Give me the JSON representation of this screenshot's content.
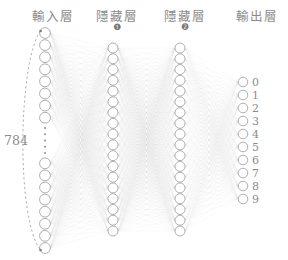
{
  "diagram": {
    "title_layers": [
      {
        "id": "input-layer",
        "label": "輸入層",
        "badge": "",
        "x": 53
      },
      {
        "id": "hidden-layer-1",
        "label": "隱藏層",
        "badge": "❶",
        "x": 117
      },
      {
        "id": "hidden-layer-2",
        "label": "隱藏層",
        "badge": "❷",
        "x": 185
      },
      {
        "id": "output-layer",
        "label": "輸出層",
        "badge": "",
        "x": 257
      }
    ],
    "input_brace_label": "784",
    "ellipsis_symbol": "⋮",
    "output_labels": [
      "0",
      "1",
      "2",
      "3",
      "4",
      "5",
      "6",
      "7",
      "8",
      "9"
    ],
    "colors": {
      "node_stroke": "#9a9a9a",
      "node_fill": "#ffffff",
      "edge": "#cfcfcf",
      "text": "#8c8c8c",
      "background": "#ffffff",
      "brace": "#9a9a9a"
    },
    "layers": {
      "input": {
        "x": 45,
        "count": 16,
        "top": 33,
        "bottom": 248,
        "gap_after": 8,
        "node_r": 5.4
      },
      "hidden1": {
        "x": 113,
        "count": 18,
        "top": 48,
        "bottom": 231,
        "node_r": 5.0
      },
      "hidden2": {
        "x": 180,
        "count": 18,
        "top": 48,
        "bottom": 231,
        "node_r": 5.0
      },
      "output": {
        "x": 243,
        "count": 10,
        "top": 82,
        "bottom": 199,
        "node_r": 4.8
      }
    }
  }
}
